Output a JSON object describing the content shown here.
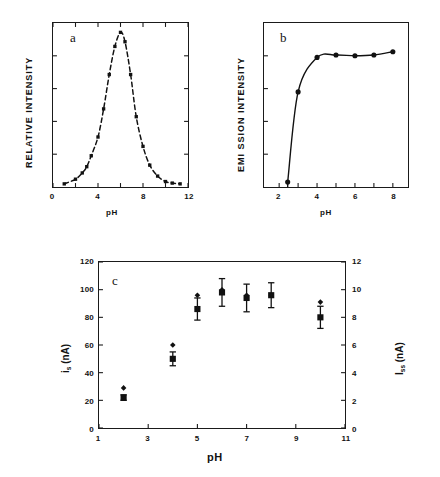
{
  "figure": {
    "panels": [
      "a",
      "b",
      "c"
    ]
  },
  "panel_a": {
    "letter": "a",
    "xlabel": "pH",
    "ylabel": "RELATIVE INTENSITY",
    "xticks": [
      "0",
      "4",
      "8",
      "12"
    ],
    "yticks": [
      "",
      "",
      "",
      "",
      ""
    ]
  },
  "panel_b": {
    "letter": "b",
    "xlabel": "pH",
    "ylabel": "EMI SSION INTENSITY",
    "xticks": [
      "2",
      "4",
      "6",
      "8"
    ],
    "yticks": [
      "",
      "",
      "",
      "",
      ""
    ]
  },
  "panel_c": {
    "letter": "c",
    "xlabel": "pH",
    "ylabel_left_main": "i",
    "ylabel_left_sub": "s",
    "ylabel_left_unit": " (nA)",
    "ylabel_right_main": "I",
    "ylabel_right_sub": "ss",
    "ylabel_right_unit": " (nA)",
    "xticks": [
      "1",
      "3",
      "5",
      "7",
      "9",
      "11"
    ],
    "yticks_left": [
      "0",
      "20",
      "40",
      "60",
      "80",
      "100",
      "120"
    ],
    "yticks_right": [
      "0",
      "2",
      "4",
      "6",
      "8",
      "10",
      "12"
    ]
  },
  "chart_data": [
    {
      "type": "line",
      "panel": "a",
      "title": "a",
      "xlabel": "pH",
      "ylabel": "RELATIVE INTENSITY",
      "xlim": [
        0,
        12
      ],
      "ylim": [
        0,
        1.05
      ],
      "xticks": [
        0,
        4,
        8,
        12
      ],
      "grid": false,
      "legend": false,
      "linestyle": "dashed",
      "marker": "square",
      "x": [
        1.0,
        2.0,
        2.6,
        3.0,
        3.4,
        4.0,
        4.5,
        5.0,
        5.5,
        6.0,
        6.4,
        6.9,
        7.4,
        8.0,
        8.6,
        9.3,
        10.0,
        10.6,
        11.3
      ],
      "y": [
        0.02,
        0.05,
        0.09,
        0.13,
        0.2,
        0.32,
        0.5,
        0.72,
        0.9,
        0.99,
        0.93,
        0.72,
        0.45,
        0.26,
        0.14,
        0.07,
        0.035,
        0.025,
        0.02
      ]
    },
    {
      "type": "line",
      "panel": "b",
      "title": "b",
      "xlabel": "pH",
      "ylabel": "EMI SSION INTENSITY",
      "xlim": [
        1.2,
        8.8
      ],
      "ylim": [
        0,
        1.0
      ],
      "xticks": [
        2,
        4,
        6,
        8
      ],
      "grid": false,
      "legend": false,
      "linestyle": "solid",
      "marker": "circle",
      "x": [
        2.45,
        3.0,
        4.0,
        5.0,
        6.0,
        7.0,
        8.0
      ],
      "y": [
        0.03,
        0.58,
        0.79,
        0.805,
        0.8,
        0.805,
        0.825
      ]
    },
    {
      "type": "scatter",
      "panel": "c",
      "title": "c",
      "xlabel": "pH",
      "ylabel": "i_s (nA)",
      "ylabel2": "I_ss (nA)",
      "xlim": [
        1,
        11
      ],
      "ylim": [
        0,
        120
      ],
      "ylim2": [
        0,
        12
      ],
      "xticks": [
        1,
        3,
        5,
        7,
        9,
        11
      ],
      "yticks": [
        0,
        20,
        40,
        60,
        80,
        100,
        120
      ],
      "yticks2": [
        0,
        2,
        4,
        6,
        8,
        10,
        12
      ],
      "grid": false,
      "legend": false,
      "series": [
        {
          "name": "i_s (left axis, squares with error bars)",
          "marker": "square",
          "axis": "left",
          "x": [
            2,
            4,
            5,
            6,
            7,
            8,
            10
          ],
          "values": [
            22,
            50,
            86,
            98,
            94,
            96,
            80
          ],
          "yerr": [
            2,
            5,
            8,
            10,
            10,
            9,
            8
          ]
        },
        {
          "name": "I_ss (right axis, diamonds)",
          "marker": "diamond",
          "axis": "left",
          "x": [
            2,
            4,
            5,
            6,
            7,
            8,
            10
          ],
          "values": [
            29,
            60,
            96,
            100,
            96,
            96,
            91
          ],
          "yerr": [
            0,
            0,
            0,
            0,
            0,
            0,
            0
          ]
        }
      ]
    }
  ]
}
